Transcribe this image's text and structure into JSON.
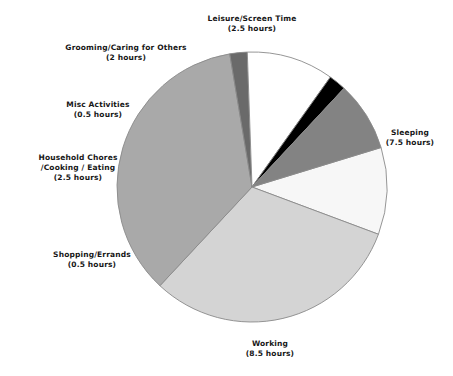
{
  "chart_data": {
    "type": "pie",
    "title": "",
    "subtitle": "",
    "xlabel": "",
    "ylabel": "",
    "unit": "hours",
    "total": 24,
    "legend_position": "none",
    "grid": false,
    "labels_outside": true,
    "start_angle_deg": -17,
    "direction": "clockwise",
    "categories": [
      "Leisure/Screen Time",
      "Sleeping",
      "Working",
      "Shopping/Errands",
      "Household Chores /Cooking / Eating",
      "Misc Activities",
      "Grooming/Caring for Others"
    ],
    "values": [
      2.5,
      7.5,
      8.5,
      0.5,
      2.5,
      0.5,
      2.0
    ],
    "colors": [
      "#f7f7f7",
      "#d4d4d4",
      "#a9a9a9",
      "#6a6a6a",
      "#ffffff",
      "#000000",
      "#838383"
    ],
    "slices": [
      {
        "id": "leisure",
        "name": "Leisure/Screen Time",
        "value": 2.5,
        "value_text": "(2.5 hours)",
        "color": "#f7f7f7",
        "percent": 10.4
      },
      {
        "id": "sleeping",
        "name": "Sleeping",
        "value": 7.5,
        "value_text": "(7.5 hours)",
        "color": "#d4d4d4",
        "percent": 31.2
      },
      {
        "id": "working",
        "name": "Working",
        "value": 8.5,
        "value_text": "(8.5 hours)",
        "color": "#a9a9a9",
        "percent": 35.4
      },
      {
        "id": "shopping",
        "name": "Shopping/Errands",
        "value": 0.5,
        "value_text": "(0.5 hours)",
        "color": "#6a6a6a",
        "percent": 2.1
      },
      {
        "id": "household",
        "name": "Household Chores",
        "name_line2": "/Cooking / Eating",
        "value": 2.5,
        "value_text": "(2.5 hours)",
        "color": "#ffffff",
        "percent": 10.4
      },
      {
        "id": "misc",
        "name": "Misc Activities",
        "value": 0.5,
        "value_text": "(0.5 hours)",
        "color": "#000000",
        "percent": 2.1
      },
      {
        "id": "grooming",
        "name": "Grooming/Caring for Others",
        "value": 2.0,
        "value_text": "(2 hours)",
        "color": "#838383",
        "percent": 8.3
      }
    ]
  },
  "geometry": {
    "center_x": 252,
    "center_y": 187,
    "radius": 135,
    "stroke_color": "#8a8a8a"
  }
}
